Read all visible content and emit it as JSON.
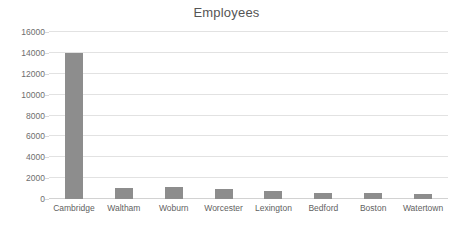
{
  "chart_data": {
    "type": "bar",
    "title": "Employees",
    "xlabel": "",
    "ylabel": "",
    "categories": [
      "Cambridge",
      "Waltham",
      "Woburn",
      "Worcester",
      "Lexington",
      "Bedford",
      "Boston",
      "Watertown"
    ],
    "values": [
      14000,
      1050,
      1150,
      950,
      800,
      600,
      580,
      500
    ],
    "ylim": [
      0,
      16000
    ],
    "yticks": [
      0,
      2000,
      4000,
      6000,
      8000,
      10000,
      12000,
      14000,
      16000
    ],
    "ytick_labels": [
      "0",
      "2000",
      "4000",
      "6000",
      "8000",
      "10000",
      "12000",
      "14000",
      "16000"
    ],
    "grid": true,
    "legend": false,
    "legend_position": "none",
    "bar_color": "#8d8d8d",
    "gridline_color": "#e2e2e2",
    "title_color": "#555555",
    "tick_label_color": "#6e6e6e",
    "background_color": "#ffffff"
  }
}
